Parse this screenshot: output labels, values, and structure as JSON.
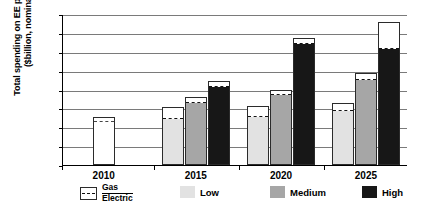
{
  "chart_data": {
    "type": "bar",
    "title": "",
    "subtitle": "",
    "xlabel": "",
    "ylabel": "Total spending on EE programs ($billion, nominal)",
    "ylabel_line1": "Total spending on EE programs",
    "ylabel_line2": "($billion, nominal)",
    "ylim": [
      0,
      16
    ],
    "ytick_step": 2,
    "yticks": [
      16,
      14,
      12,
      10,
      8,
      6,
      4,
      2,
      0
    ],
    "categories": [
      "2010",
      "2015",
      "2020",
      "2025"
    ],
    "grid": "horizontal",
    "legend_position": "bottom",
    "stacking": "Each bar is split by a dashed line: Electric spending below, Gas spending above",
    "series": [
      {
        "name": "Actual",
        "scenario": "actual",
        "legend_label": "Gas / Electric",
        "color": "#ffffff",
        "bars": [
          {
            "year": "2010",
            "total": 5.1,
            "electric": 4.5,
            "gas": 0.6
          }
        ]
      },
      {
        "name": "Low",
        "scenario": "low",
        "color": "#e2e2e2",
        "bars": [
          {
            "year": "2015",
            "total": 6.2,
            "electric": 4.8,
            "gas": 1.4
          },
          {
            "year": "2020",
            "total": 6.3,
            "electric": 5.0,
            "gas": 1.3
          },
          {
            "year": "2025",
            "total": 6.6,
            "electric": 5.6,
            "gas": 1.0
          }
        ]
      },
      {
        "name": "Medium",
        "scenario": "medium",
        "color": "#a6a6a6",
        "bars": [
          {
            "year": "2015",
            "total": 7.2,
            "electric": 6.5,
            "gas": 0.7
          },
          {
            "year": "2020",
            "total": 8.0,
            "electric": 7.3,
            "gas": 0.7
          },
          {
            "year": "2025",
            "total": 9.7,
            "electric": 8.9,
            "gas": 0.8
          }
        ]
      },
      {
        "name": "High",
        "scenario": "high",
        "color": "#171717",
        "bars": [
          {
            "year": "2015",
            "total": 8.9,
            "electric": 8.2,
            "gas": 0.7
          },
          {
            "year": "2020",
            "total": 13.5,
            "electric": 12.7,
            "gas": 0.8
          },
          {
            "year": "2025",
            "total": 15.2,
            "electric": 12.2,
            "gas": 3.0
          }
        ]
      }
    ]
  },
  "legend": {
    "items": [
      {
        "label": "Gas",
        "sublabel": "Electric",
        "swatch": "outline-dashed",
        "color": "#ffffff"
      },
      {
        "label": "Low",
        "swatch": "solid",
        "color": "#e2e2e2"
      },
      {
        "label": "Medium",
        "swatch": "solid",
        "color": "#a6a6a6"
      },
      {
        "label": "High",
        "swatch": "solid",
        "color": "#171717"
      }
    ]
  }
}
